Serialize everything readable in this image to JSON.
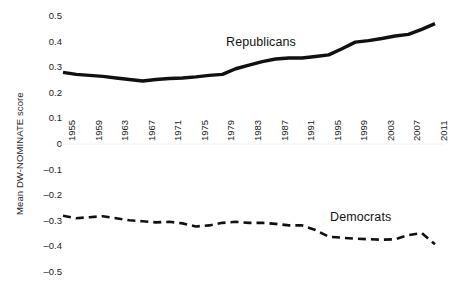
{
  "chart_data": {
    "type": "line",
    "title": "",
    "xlabel": "",
    "ylabel": "Mean DW-NOMINATE score",
    "ylim": [
      -0.5,
      0.5
    ],
    "xlim": [
      1955,
      2011
    ],
    "grid": false,
    "legend_position": "inline-annotation",
    "ytick_labels": [
      "0.5",
      "0.4",
      "0.3",
      "0.2",
      "0.1",
      "0",
      "-0.1",
      "-0.2",
      "-0.3",
      "-0.4",
      "-0.5"
    ],
    "ytick_values": [
      0.5,
      0.4,
      0.3,
      0.2,
      0.1,
      0,
      -0.1,
      -0.2,
      -0.3,
      -0.4,
      -0.5
    ],
    "xtick_labels": [
      "1955",
      "1959",
      "1963",
      "1967",
      "1971",
      "1975",
      "1979",
      "1983",
      "1987",
      "1991",
      "1995",
      "1999",
      "2003",
      "2007",
      "2011"
    ],
    "xtick_values": [
      1955,
      1959,
      1963,
      1967,
      1971,
      1975,
      1979,
      1983,
      1987,
      1991,
      1995,
      1999,
      2003,
      2007,
      2011
    ],
    "x": [
      1955,
      1957,
      1959,
      1961,
      1963,
      1965,
      1967,
      1969,
      1971,
      1973,
      1975,
      1977,
      1979,
      1981,
      1983,
      1985,
      1987,
      1989,
      1991,
      1993,
      1995,
      1997,
      1999,
      2001,
      2003,
      2005,
      2007,
      2009,
      2011
    ],
    "series": [
      {
        "name": "Republicans",
        "style": "solid",
        "color": "#111111",
        "values": [
          0.28,
          0.272,
          0.268,
          0.264,
          0.258,
          0.252,
          0.246,
          0.252,
          0.256,
          0.258,
          0.262,
          0.268,
          0.272,
          0.294,
          0.308,
          0.322,
          0.332,
          0.336,
          0.336,
          0.342,
          0.348,
          0.372,
          0.398,
          0.404,
          0.412,
          0.422,
          0.428,
          0.448,
          0.47
        ]
      },
      {
        "name": "Democrats",
        "style": "dashed",
        "color": "#111111",
        "values": [
          -0.28,
          -0.29,
          -0.286,
          -0.282,
          -0.29,
          -0.298,
          -0.302,
          -0.306,
          -0.304,
          -0.31,
          -0.322,
          -0.318,
          -0.308,
          -0.304,
          -0.308,
          -0.308,
          -0.312,
          -0.318,
          -0.318,
          -0.336,
          -0.362,
          -0.366,
          -0.37,
          -0.372,
          -0.374,
          -0.372,
          -0.356,
          -0.348,
          -0.392
        ]
      }
    ],
    "annotations": [
      {
        "text": "Republicans",
        "series": "Republicans"
      },
      {
        "text": "Democrats",
        "series": "Democrats"
      }
    ]
  }
}
